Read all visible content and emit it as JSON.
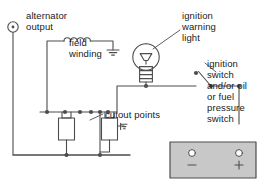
{
  "diagram": {
    "labels": {
      "alternator_output": "alternator\noutput",
      "field_winding": "field\nwinding",
      "ignition_warning_light": "ignition\nwarning\nlight",
      "ignition_switch": "ignition\nswitch\nand/or oil\nor fuel\npressure\nswitch",
      "cutout_points": "cutout points"
    },
    "battery": {
      "negative_terminal": "−",
      "positive_terminal": "+"
    },
    "icons": {
      "alternator_terminal": "terminal-circle-dot-icon",
      "field_winding_coil": "inductor-coil-icon",
      "field_ground": "ground-earth-icon",
      "lamp": "light-bulb-icon",
      "ignition_switch": "spst-switch-icon",
      "cutout_points": "switch-contacts-icon",
      "relay_coil_left": "relay-coil-icon",
      "relay_coil_right": "relay-coil-icon",
      "relay_ground": "ground-earth-icon",
      "battery": "battery-block-icon"
    },
    "colors": {
      "wire": "#4d4d4d",
      "text": "#1a1a1a",
      "battery_fill": "#c8c8c8",
      "battery_stroke": "#4d4d4d",
      "background": "#ffffff"
    }
  }
}
